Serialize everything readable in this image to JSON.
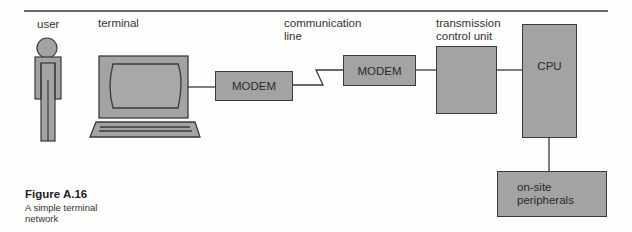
{
  "labels": {
    "user": "user",
    "terminal": "terminal",
    "communication_line": [
      "communication",
      "line"
    ],
    "transmission_control_unit": [
      "transmission",
      "control unit"
    ]
  },
  "boxes": {
    "modem_1": "MODEM",
    "modem_2": "MODEM",
    "tcu": "",
    "cpu": "CPU",
    "peripherals": [
      "on-site",
      "peripherals"
    ]
  },
  "caption": {
    "title": "Figure A.16",
    "text": [
      "A simple terminal",
      "network"
    ]
  },
  "colors": {
    "fill": "#a3a3a3",
    "stroke": "#3a3a3a",
    "background": "#fdfdfb"
  }
}
